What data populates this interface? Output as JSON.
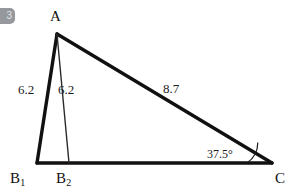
{
  "badge": {
    "text": "3",
    "color": "#8d9196"
  },
  "figure": {
    "type": "geometry-diagram",
    "background": "#ffffff",
    "stroke_color": "#111111",
    "vertices": [
      {
        "name": "A",
        "label": "A",
        "x": 57,
        "y": 34
      },
      {
        "name": "B1",
        "label": "B",
        "sub": "1",
        "x": 37,
        "y": 163
      },
      {
        "name": "B2",
        "label": "B",
        "sub": "2",
        "x": 69,
        "y": 163
      },
      {
        "name": "C",
        "label": "C",
        "x": 272,
        "y": 163
      }
    ],
    "edges": [
      {
        "name": "A-B1",
        "from": "A",
        "to": "B1",
        "weight": "thick"
      },
      {
        "name": "A-B2",
        "from": "A",
        "to": "B2",
        "weight": "thin"
      },
      {
        "name": "A-C",
        "from": "A",
        "to": "C",
        "weight": "thick"
      },
      {
        "name": "B1-C",
        "from": "B1",
        "to": "C",
        "weight": "thick"
      }
    ],
    "side_labels": [
      {
        "name": "side-ab1",
        "text": "6.2",
        "edge": "A-B1"
      },
      {
        "name": "side-ab2",
        "text": "6.2",
        "edge": "A-B2"
      },
      {
        "name": "side-ac",
        "text": "8.7",
        "edge": "A-C"
      }
    ],
    "angle_labels": [
      {
        "name": "angle-c",
        "text": "37.5°",
        "vertex": "C",
        "arc": true
      }
    ]
  }
}
